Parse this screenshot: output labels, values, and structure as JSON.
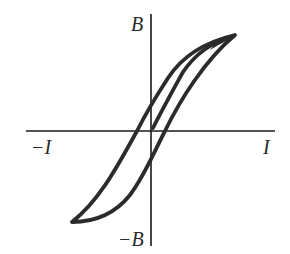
{
  "diagram": {
    "type": "hysteresis-loop",
    "axes": {
      "y_top_label": "B",
      "y_bottom_label": "−B",
      "x_left_label": "−I",
      "x_right_label": "I"
    },
    "curves": [
      {
        "name": "hysteresis-loop",
        "description": "closed B-I hysteresis loop"
      },
      {
        "name": "initial-magnetization-curve",
        "description": "curve from origin to saturation"
      }
    ],
    "colors": {
      "stroke": "#2b2b2b",
      "background": "#ffffff"
    }
  }
}
